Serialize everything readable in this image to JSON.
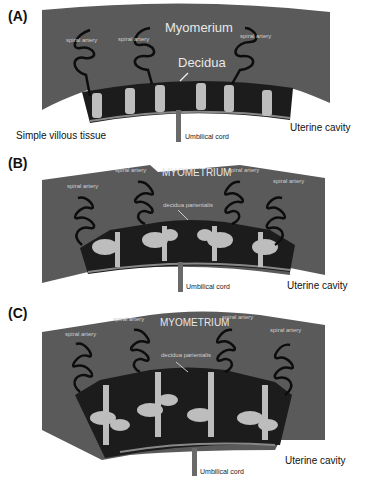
{
  "panels": [
    {
      "id": "A",
      "label": "(A)",
      "myometrium": "Myomerium",
      "decidua": "Decidua",
      "spiral_arteries": [
        "spiral artery",
        "spiral artery",
        "spiral artery"
      ],
      "left_caption": "Simple villous tissue",
      "umbilical": "Umbilical cord",
      "cavity": "Uterine cavity"
    },
    {
      "id": "B",
      "label": "(B)",
      "myometrium": "MYOMETRIUM",
      "decidua": "decidua parientalis",
      "spiral_arteries": [
        "spiral artery",
        "spiral artery",
        "spiral artery",
        "spiral artery"
      ],
      "umbilical": "Umbilical cord",
      "cavity": "Uterine cavity"
    },
    {
      "id": "C",
      "label": "(C)",
      "myometrium": "MYOMETRIUM",
      "decidua": "decidua parientalis",
      "spiral_arteries": [
        "spiral artery",
        "spiral artery",
        "spiral artery",
        "spiral artery"
      ],
      "umbilical": "Umbilical cord",
      "cavity": "Uterine cavity"
    }
  ],
  "colors": {
    "myometrium": "#5a5a5a",
    "placenta": "#1c1c1c",
    "villi": "#bdbdbd",
    "artery": "#0d0d0d",
    "cord": "#6a6a6a"
  }
}
